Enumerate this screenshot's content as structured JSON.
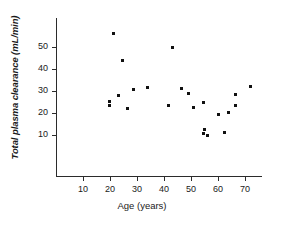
{
  "chart_data": {
    "type": "scatter",
    "title": "",
    "xlabel": "Age (years)",
    "ylabel": "Total plasma clearance (mL/min)",
    "xlim": [
      3,
      76
    ],
    "ylim": [
      2,
      60
    ],
    "grid": false,
    "legend": null,
    "xticks": [
      10,
      20,
      30,
      40,
      50,
      60,
      70
    ],
    "yticks": [
      10,
      20,
      30,
      40,
      50
    ],
    "xtick_labels": [
      "10",
      "20",
      "30",
      "40",
      "50",
      "60",
      "70"
    ],
    "ytick_labels": [
      "10",
      "20",
      "30",
      "40",
      "50"
    ],
    "marker": "square",
    "marker_color": "#111111",
    "points": [
      {
        "x": 21.2,
        "y": 56.0
      },
      {
        "x": 43.3,
        "y": 49.6
      },
      {
        "x": 24.7,
        "y": 43.8
      },
      {
        "x": 33.9,
        "y": 31.8
      },
      {
        "x": 46.3,
        "y": 31.2
      },
      {
        "x": 28.6,
        "y": 30.8
      },
      {
        "x": 72.0,
        "y": 32.2
      },
      {
        "x": 48.9,
        "y": 28.9
      },
      {
        "x": 23.1,
        "y": 27.9
      },
      {
        "x": 66.4,
        "y": 28.2
      },
      {
        "x": 19.8,
        "y": 25.4
      },
      {
        "x": 54.6,
        "y": 24.8
      },
      {
        "x": 19.8,
        "y": 23.4
      },
      {
        "x": 41.6,
        "y": 23.3
      },
      {
        "x": 66.5,
        "y": 23.4
      },
      {
        "x": 51.1,
        "y": 22.6
      },
      {
        "x": 26.3,
        "y": 22.2
      },
      {
        "x": 63.8,
        "y": 20.3
      },
      {
        "x": 60.0,
        "y": 19.1
      },
      {
        "x": 55.0,
        "y": 12.6
      },
      {
        "x": 54.8,
        "y": 10.6
      },
      {
        "x": 56.2,
        "y": 9.8
      },
      {
        "x": 62.3,
        "y": 11.1
      }
    ]
  },
  "axes": {
    "y_axis_title": "Total plasma clearance (mL/min)",
    "x_axis_title": "Age (years)"
  }
}
